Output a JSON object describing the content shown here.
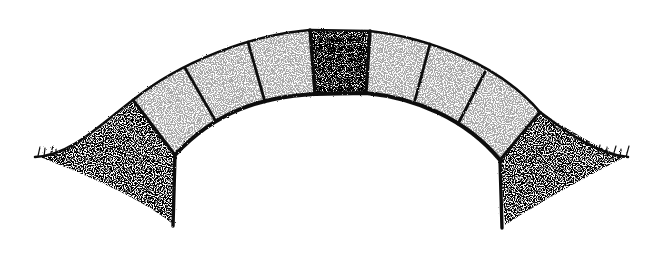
{
  "illustration": {
    "subject": "stone arch bridge",
    "style": "stippled ink drawing",
    "voussoir_count": 10,
    "keystone_index": 4,
    "colors": {
      "ink": "#111111",
      "paper": "#ffffff"
    }
  }
}
